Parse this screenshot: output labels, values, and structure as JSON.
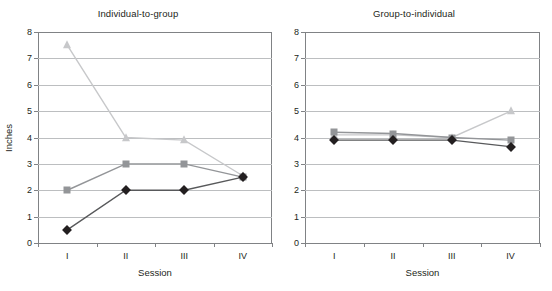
{
  "figure": {
    "width": 552,
    "height": 291,
    "background": "#ffffff"
  },
  "chart_data": [
    {
      "type": "line",
      "panel_id": "individual-to-group",
      "title": "Individual-to-group",
      "xlabel": "Session",
      "ylabel": "Inches",
      "categories": [
        "I",
        "II",
        "III",
        "IV"
      ],
      "ylim": [
        0,
        8
      ],
      "yticks": [
        0,
        1,
        2,
        3,
        4,
        5,
        6,
        7,
        8
      ],
      "ytick_labels": [
        "0",
        "1",
        "2",
        "3",
        "4",
        "5",
        "6",
        "7",
        "8"
      ],
      "grid": "horizontal",
      "legend": "none",
      "series": [
        {
          "name": "series-light-triangle",
          "marker": "triangle",
          "color": "#c7c8ca",
          "line_color": "#c7c8ca",
          "values": [
            7.5,
            4.0,
            3.9,
            2.55
          ]
        },
        {
          "name": "series-medium-square",
          "marker": "square",
          "color": "#939598",
          "line_color": "#939598",
          "values": [
            2.0,
            3.0,
            3.0,
            2.5
          ]
        },
        {
          "name": "series-dark-diamond",
          "marker": "diamond",
          "color": "#231f20",
          "line_color": "#58595b",
          "values": [
            0.5,
            2.0,
            2.0,
            2.5
          ]
        }
      ]
    },
    {
      "type": "line",
      "panel_id": "group-to-individual",
      "title": "Group-to-individual",
      "xlabel": "Session",
      "ylabel": "",
      "categories": [
        "I",
        "II",
        "III",
        "IV"
      ],
      "ylim": [
        0,
        8
      ],
      "yticks": [
        0,
        1,
        2,
        3,
        4,
        5,
        6,
        7,
        8
      ],
      "ytick_labels": [
        "0",
        "1",
        "2",
        "3",
        "4",
        "5",
        "6",
        "7",
        "8"
      ],
      "grid": "horizontal",
      "legend": "none",
      "series": [
        {
          "name": "series-light-triangle",
          "marker": "triangle",
          "color": "#c7c8ca",
          "line_color": "#c7c8ca",
          "values": [
            4.1,
            4.1,
            4.0,
            5.0
          ]
        },
        {
          "name": "series-medium-square",
          "marker": "square",
          "color": "#939598",
          "line_color": "#939598",
          "values": [
            4.2,
            4.15,
            4.0,
            3.9
          ]
        },
        {
          "name": "series-dark-diamond",
          "marker": "diamond",
          "color": "#231f20",
          "line_color": "#58595b",
          "values": [
            3.9,
            3.9,
            3.9,
            3.65
          ]
        }
      ]
    }
  ],
  "colors": {
    "axis": "#808285",
    "gridline": "#bcbec0",
    "text": "#231f20"
  }
}
